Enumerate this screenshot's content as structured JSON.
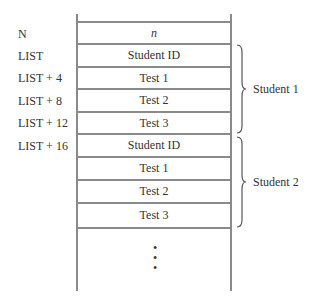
{
  "diagram": {
    "addresses": [
      {
        "label": "N"
      },
      {
        "label": "LIST"
      },
      {
        "label": "LIST + 4"
      },
      {
        "label": "LIST + 8"
      },
      {
        "label": "LIST + 12"
      },
      {
        "label": "LIST + 16"
      }
    ],
    "cells": [
      {
        "label": "n"
      },
      {
        "label": "Student ID"
      },
      {
        "label": "Test 1"
      },
      {
        "label": "Test 2"
      },
      {
        "label": "Test 3"
      },
      {
        "label": "Student ID"
      },
      {
        "label": "Test 1"
      },
      {
        "label": "Test 2"
      },
      {
        "label": "Test 3"
      }
    ],
    "groups": [
      {
        "label": "Student 1"
      },
      {
        "label": "Student 2"
      }
    ],
    "continuation": "⋮",
    "colors": {
      "line": "#8a8a8a",
      "text": "#333333"
    }
  }
}
